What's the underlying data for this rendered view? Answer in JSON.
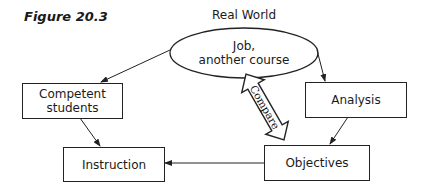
{
  "figure": {
    "title": "Figure 20.3",
    "header_label": "Real World"
  },
  "nodes": {
    "real_world": {
      "line1": "Job,",
      "line2": "another course"
    },
    "competent": {
      "line1": "Competent",
      "line2": "students"
    },
    "analysis": {
      "label": "Analysis"
    },
    "instruction": {
      "label": "Instruction"
    },
    "objectives": {
      "label": "Objectives"
    }
  },
  "connector": {
    "compare_label": "Compare"
  },
  "edges": [
    {
      "from": "Job, another course",
      "to": "Competent students"
    },
    {
      "from": "Job, another course",
      "to": "Analysis"
    },
    {
      "from": "Competent students",
      "to": "Instruction"
    },
    {
      "from": "Analysis",
      "to": "Objectives"
    },
    {
      "from": "Objectives",
      "to": "Instruction"
    },
    {
      "from": "Job, another course",
      "to": "Objectives",
      "type": "double-arrow",
      "label": "Compare"
    }
  ]
}
